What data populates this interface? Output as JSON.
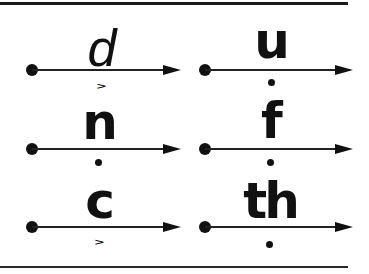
{
  "diagram": {
    "type": "phonics-sound-lines",
    "cells": [
      {
        "letter": "d",
        "marker": "short-chevron",
        "marker_glyph": ">"
      },
      {
        "letter": "u",
        "marker": "dot",
        "marker_glyph": ""
      },
      {
        "letter": "n",
        "marker": "dot",
        "marker_glyph": ""
      },
      {
        "letter": "f",
        "marker": "dot",
        "marker_glyph": ""
      },
      {
        "letter": "c",
        "marker": "short-chevron",
        "marker_glyph": ">"
      },
      {
        "letter": "th",
        "marker": "dot",
        "marker_glyph": ""
      }
    ],
    "colors": {
      "ink": "#111111",
      "background": "#ffffff"
    }
  }
}
